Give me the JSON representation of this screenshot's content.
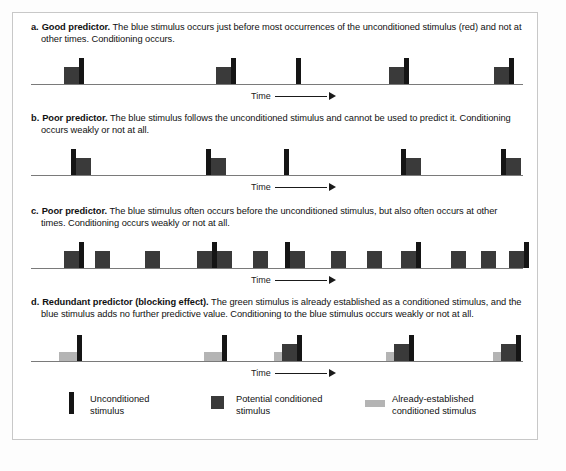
{
  "figure": {
    "colors": {
      "unconditioned_stimulus": "#151515",
      "potential_conditioned_stimulus": "#3a3a3a",
      "already_established_conditioned_stimulus": "#b4b4b4",
      "axis": "#7a7a7a",
      "frame_border": "#c8c8c8",
      "background": "#ffffff"
    }
  },
  "panels": [
    {
      "id": "a",
      "letter": "a.",
      "lead": "Good predictor.",
      "body": " The blue stimulus occurs just before most occurrences of the unconditioned stimulus (red) and not at other times. Conditioning occurs.",
      "time_label": "Time"
    },
    {
      "id": "b",
      "letter": "b.",
      "lead": "Poor predictor.",
      "body": " The blue stimulus follows the unconditioned stimulus and cannot be used to predict it. Conditioning occurs weakly or not at all.",
      "time_label": "Time"
    },
    {
      "id": "c",
      "letter": "c.",
      "lead": "Poor predictor.",
      "body": " The blue stimulus often occurs before the unconditioned stimulus, but also often occurs at other times. Conditioning occurs weakly or not at all.",
      "time_label": "Time"
    },
    {
      "id": "d",
      "letter": "d.",
      "lead": "Redundant predictor (blocking effect).",
      "body": " The green stimulus is already established as a conditioned stimulus, and the blue stimulus adds no further predictive value. Conditioning to the blue stimulus occurs weakly or not at all.",
      "time_label": "Time"
    }
  ],
  "legend": {
    "items": [
      {
        "swatch": "us-bar-swatch",
        "label": "Unconditioned\nstimulus"
      },
      {
        "swatch": "cs-square-swatch",
        "label": "Potential conditioned\nstimulus"
      },
      {
        "swatch": "established-cs-swatch",
        "label": "Already-established\nconditioned stimulus"
      }
    ]
  },
  "chart_data": {
    "type": "timeline",
    "xlabel": "Time",
    "axis_width_px": 492,
    "bar_kinds": {
      "us": {
        "name": "Unconditioned stimulus",
        "width": 5,
        "height": 26,
        "color": "#151515"
      },
      "cs": {
        "name": "Potential conditioned stimulus",
        "width": 15,
        "height": 17,
        "color": "#3a3a3a"
      },
      "est": {
        "name": "Already-established conditioned stimulus",
        "width": 18,
        "height": 9,
        "color": "#b4b4b4"
      }
    },
    "panels": [
      {
        "id": "a",
        "bars": [
          {
            "kind": "cs",
            "x": 33,
            "h": 17
          },
          {
            "kind": "us",
            "x": 48,
            "h": 26
          },
          {
            "kind": "cs",
            "x": 185,
            "h": 17
          },
          {
            "kind": "us",
            "x": 200,
            "h": 26
          },
          {
            "kind": "us",
            "x": 265,
            "h": 26
          },
          {
            "kind": "cs",
            "x": 358,
            "h": 17
          },
          {
            "kind": "us",
            "x": 373,
            "h": 26
          },
          {
            "kind": "cs",
            "x": 463,
            "h": 17
          },
          {
            "kind": "us",
            "x": 478,
            "h": 26
          }
        ]
      },
      {
        "id": "b",
        "bars": [
          {
            "kind": "us",
            "x": 40,
            "h": 26
          },
          {
            "kind": "cs",
            "x": 45,
            "h": 17
          },
          {
            "kind": "us",
            "x": 175,
            "h": 26
          },
          {
            "kind": "cs",
            "x": 180,
            "h": 17
          },
          {
            "kind": "us",
            "x": 253,
            "h": 26
          },
          {
            "kind": "us",
            "x": 370,
            "h": 26
          },
          {
            "kind": "cs",
            "x": 375,
            "h": 17
          },
          {
            "kind": "us",
            "x": 470,
            "h": 26
          },
          {
            "kind": "cs",
            "x": 475,
            "h": 17
          }
        ]
      },
      {
        "id": "c",
        "bars": [
          {
            "kind": "cs",
            "x": 33,
            "h": 17
          },
          {
            "kind": "us",
            "x": 48,
            "h": 26
          },
          {
            "kind": "cs",
            "x": 64,
            "h": 17
          },
          {
            "kind": "cs",
            "x": 114,
            "h": 17
          },
          {
            "kind": "cs",
            "x": 166,
            "h": 17
          },
          {
            "kind": "us",
            "x": 181,
            "h": 26
          },
          {
            "kind": "cs",
            "x": 186,
            "h": 17
          },
          {
            "kind": "cs",
            "x": 222,
            "h": 17
          },
          {
            "kind": "us",
            "x": 254,
            "h": 26
          },
          {
            "kind": "cs",
            "x": 259,
            "h": 17
          },
          {
            "kind": "cs",
            "x": 300,
            "h": 17
          },
          {
            "kind": "cs",
            "x": 336,
            "h": 17
          },
          {
            "kind": "cs",
            "x": 370,
            "h": 17
          },
          {
            "kind": "us",
            "x": 385,
            "h": 26
          },
          {
            "kind": "cs",
            "x": 420,
            "h": 17
          },
          {
            "kind": "cs",
            "x": 450,
            "h": 17
          },
          {
            "kind": "cs",
            "x": 478,
            "h": 17
          },
          {
            "kind": "us",
            "x": 493,
            "h": 26
          }
        ]
      },
      {
        "id": "d",
        "bars": [
          {
            "kind": "est",
            "x": 28,
            "h": 9
          },
          {
            "kind": "us",
            "x": 46,
            "h": 26
          },
          {
            "kind": "est",
            "x": 173,
            "h": 9
          },
          {
            "kind": "us",
            "x": 191,
            "h": 26
          },
          {
            "kind": "est",
            "x": 243,
            "h": 9
          },
          {
            "kind": "cs",
            "x": 251,
            "h": 17
          },
          {
            "kind": "us",
            "x": 266,
            "h": 26
          },
          {
            "kind": "est",
            "x": 355,
            "h": 9
          },
          {
            "kind": "cs",
            "x": 363,
            "h": 17
          },
          {
            "kind": "us",
            "x": 378,
            "h": 26
          },
          {
            "kind": "est",
            "x": 462,
            "h": 9
          },
          {
            "kind": "cs",
            "x": 470,
            "h": 17
          },
          {
            "kind": "us",
            "x": 485,
            "h": 26
          }
        ]
      }
    ]
  }
}
